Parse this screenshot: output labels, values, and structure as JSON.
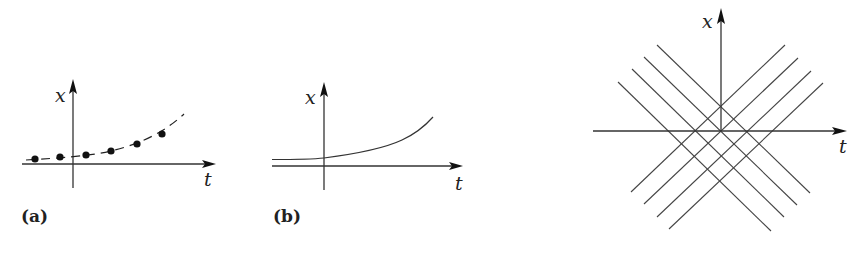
{
  "panels": [
    {
      "id": "a",
      "label": "(a)",
      "x_axis_label": "t",
      "y_axis_label": "x",
      "description": "discrete points along dashed exponential curve"
    },
    {
      "id": "b",
      "label": "(b)",
      "x_axis_label": "t",
      "y_axis_label": "x",
      "description": "continuous exponential curve"
    },
    {
      "id": "c",
      "label": "",
      "x_axis_label": "t",
      "y_axis_label": "x",
      "description": "two families of parallel diagonal lines (characteristics) crossing the axes"
    }
  ],
  "colors": {
    "ink": "#222222",
    "background": "#ffffff"
  }
}
